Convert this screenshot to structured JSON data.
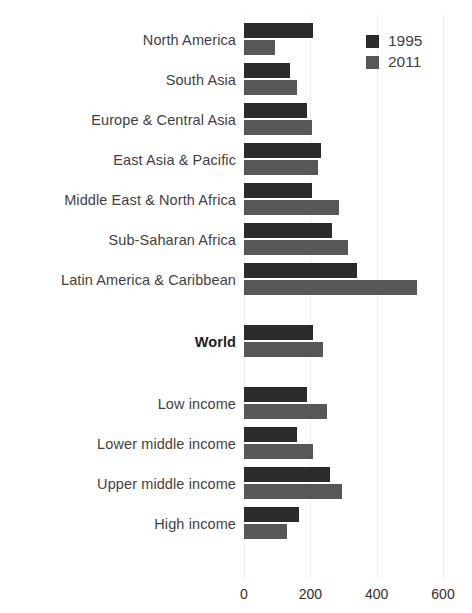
{
  "chart_data": {
    "type": "bar",
    "orientation": "horizontal",
    "title": "",
    "xlabel": "",
    "ylabel": "",
    "xlim": [
      0,
      600
    ],
    "xticks": [
      0,
      200,
      400,
      600
    ],
    "grid": true,
    "legend_position": "top-right",
    "categories": [
      "North America",
      "South Asia",
      "Europe & Central Asia",
      "East Asia & Pacific",
      "Middle East & North Africa",
      "Sub-Saharan Africa",
      "Latin America & Caribbean",
      "World",
      "Low income",
      "Lower middle income",
      "Upper middle income",
      "High income"
    ],
    "emphasized_categories": [
      "World"
    ],
    "series": [
      {
        "name": "1995",
        "color": "#2b2b2b",
        "values": [
          207,
          140,
          190,
          232,
          205,
          265,
          340,
          207,
          190,
          160,
          259,
          166
        ]
      },
      {
        "name": "2011",
        "color": "#575757",
        "values": [
          93,
          160,
          205,
          223,
          286,
          313,
          521,
          238,
          250,
          207,
          295,
          129
        ]
      }
    ]
  },
  "legend": {
    "items": [
      {
        "label": "1995",
        "color": "#2b2b2b",
        "swatch": "legend-swatch-1995"
      },
      {
        "label": "2011",
        "color": "#575757",
        "swatch": "legend-swatch-2011"
      }
    ]
  },
  "axis": {
    "tick_labels": [
      "0",
      "200",
      "400",
      "600"
    ]
  },
  "layout": {
    "group_gaps_after": [
      6,
      7
    ],
    "background": "#ffffff"
  }
}
